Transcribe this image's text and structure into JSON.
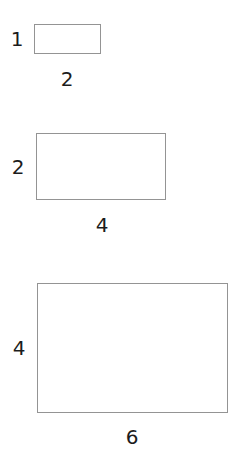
{
  "figure": {
    "background_color": "#ffffff",
    "stroke_color": "#949494",
    "label_color": "#1c1c1c",
    "shapes": [
      {
        "name": "small-rectangle",
        "height_label": "1",
        "width_label": "2"
      },
      {
        "name": "medium-rectangle",
        "height_label": "2",
        "width_label": "4"
      },
      {
        "name": "large-rectangle",
        "height_label": "4",
        "width_label": "6"
      }
    ]
  },
  "chart_data": {
    "type": "diagram",
    "title": "",
    "subtitle": "",
    "xlabel": "",
    "ylabel": "",
    "categories": [
      "small-rectangle",
      "medium-rectangle",
      "large-rectangle"
    ],
    "series": [
      {
        "name": "height",
        "values": [
          1,
          2,
          4
        ]
      },
      {
        "name": "width",
        "values": [
          2,
          4,
          6
        ]
      }
    ],
    "pixel_geometry": [
      {
        "x": 34,
        "y": 24,
        "width": 67,
        "height": 30
      },
      {
        "x": 36,
        "y": 133,
        "width": 130,
        "height": 67
      },
      {
        "x": 37,
        "y": 283,
        "width": 191,
        "height": 130
      }
    ],
    "grid": false,
    "legend": false
  }
}
